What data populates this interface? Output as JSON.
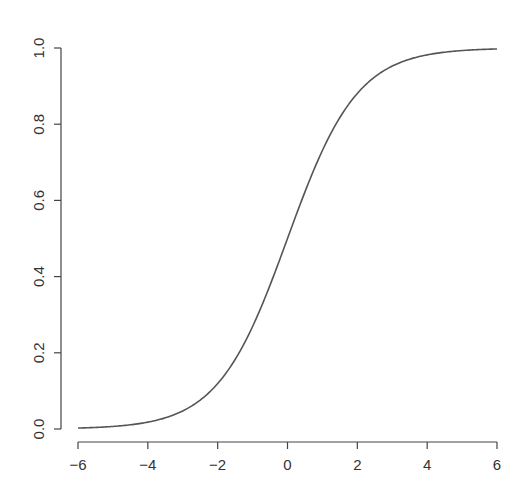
{
  "chart_data": {
    "type": "line",
    "title": "",
    "xlabel": "",
    "ylabel": "",
    "function": "logistic: y = 1 / (1 + exp(-x))",
    "xlim": [
      -6,
      6
    ],
    "ylim": [
      0,
      1
    ],
    "grid": false,
    "legend": null,
    "x_ticks": [
      -6,
      -4,
      -2,
      0,
      2,
      4,
      6
    ],
    "x_tick_labels": [
      "−6",
      "−4",
      "−2",
      "0",
      "2",
      "4",
      "6"
    ],
    "y_ticks": [
      0.0,
      0.2,
      0.4,
      0.6,
      0.8,
      1.0
    ],
    "y_tick_labels": [
      "0.0",
      "0.2",
      "0.4",
      "0.6",
      "0.8",
      "1.0"
    ],
    "series": [
      {
        "name": "sigmoid",
        "color": "#555555",
        "x": [
          -6,
          -5,
          -4,
          -3,
          -2,
          -1,
          0,
          1,
          2,
          3,
          4,
          5,
          6
        ],
        "values": [
          0.0025,
          0.0067,
          0.018,
          0.047,
          0.119,
          0.269,
          0.5,
          0.731,
          0.881,
          0.953,
          0.982,
          0.993,
          0.9975
        ]
      }
    ]
  },
  "colors": {
    "axis": "#444444",
    "curve": "#555555",
    "text": "#333333",
    "background": "#ffffff"
  }
}
